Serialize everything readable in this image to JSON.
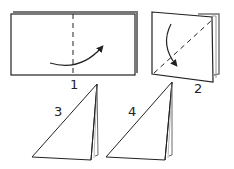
{
  "diagram": {
    "title": "",
    "type": "origami folding steps",
    "steps": [
      {
        "number": "1",
        "shape": "rectangle",
        "fold_line": "vertical dashed center",
        "arrow": "curved, left to right"
      },
      {
        "number": "2",
        "shape": "folded square",
        "fold_line": "diagonal dashed",
        "arrow": "curved, top to bottom-left"
      },
      {
        "number": "3",
        "shape": "right triangle"
      },
      {
        "number": "4",
        "shape": "right triangle"
      }
    ],
    "colors": {
      "line": "#222222",
      "background": "#ffffff"
    }
  }
}
